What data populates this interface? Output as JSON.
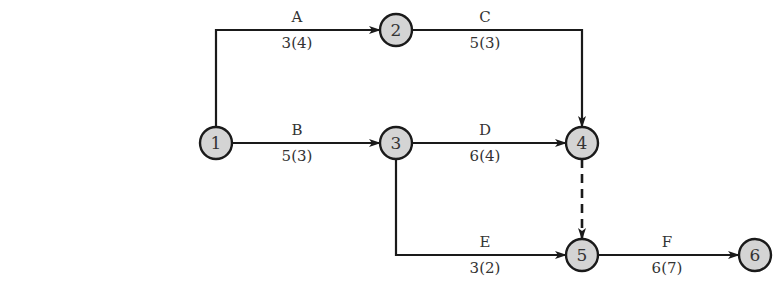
{
  "diagram": {
    "type": "activity-on-arrow network",
    "colors": {
      "line": "#1a1a1a",
      "node_fill": "#d4d4d4",
      "text": "#333333"
    },
    "nodes": [
      {
        "id": "1",
        "label": "1",
        "x": 216,
        "y": 143
      },
      {
        "id": "2",
        "label": "2",
        "x": 396,
        "y": 30
      },
      {
        "id": "3",
        "label": "3",
        "x": 396,
        "y": 143
      },
      {
        "id": "4",
        "label": "4",
        "x": 582,
        "y": 143
      },
      {
        "id": "5",
        "label": "5",
        "x": 582,
        "y": 255
      },
      {
        "id": "6",
        "label": "6",
        "x": 755,
        "y": 255
      }
    ],
    "activities": [
      {
        "name": "A",
        "from": "1",
        "to": "2",
        "duration": "3(4)"
      },
      {
        "name": "B",
        "from": "1",
        "to": "3",
        "duration": "5(3)"
      },
      {
        "name": "C",
        "from": "2",
        "to": "4",
        "duration": "5(3)"
      },
      {
        "name": "D",
        "from": "3",
        "to": "4",
        "duration": "6(4)"
      },
      {
        "name": "E",
        "from": "3",
        "to": "5",
        "duration": "3(2)"
      },
      {
        "name": "F",
        "from": "5",
        "to": "6",
        "duration": "6(7)"
      }
    ],
    "dummy": [
      {
        "from": "4",
        "to": "5",
        "style": "dashed"
      }
    ]
  }
}
